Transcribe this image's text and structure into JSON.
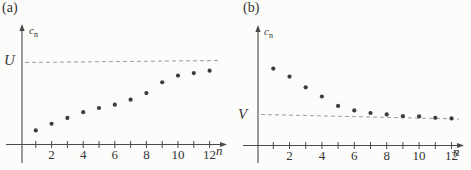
{
  "chart_data": [
    {
      "type": "scatter",
      "panel_label": "(a)",
      "title": "",
      "xlabel": "n",
      "ylabel": "c_n",
      "ylabel_base": "c",
      "ylabel_sub": "n",
      "x": [
        1,
        2,
        3,
        4,
        5,
        6,
        7,
        8,
        9,
        10,
        11,
        12
      ],
      "values": [
        0.17,
        0.25,
        0.32,
        0.39,
        0.44,
        0.48,
        0.54,
        0.62,
        0.75,
        0.83,
        0.86,
        0.89
      ],
      "values_note": "values read relative to dashed bound U = 1.0",
      "bound_line": {
        "label": "U",
        "value": 1.0,
        "style": "dashed",
        "relation": "upper-bound"
      },
      "x_tick_values": [
        2,
        4,
        6,
        8,
        10,
        12
      ],
      "x_tick_labels": [
        "2",
        "4",
        "6",
        "8",
        "10",
        "12"
      ],
      "xlim": [
        0,
        13
      ],
      "ylim": [
        0,
        1.4
      ],
      "grid": false,
      "legend": null
    },
    {
      "type": "scatter",
      "panel_label": "(b)",
      "title": "",
      "xlabel": "n",
      "ylabel": "c_n",
      "ylabel_base": "c",
      "ylabel_sub": "n",
      "x": [
        1,
        2,
        3,
        4,
        5,
        6,
        7,
        8,
        9,
        10,
        11,
        12
      ],
      "values": [
        2.7,
        2.42,
        2.04,
        1.72,
        1.39,
        1.23,
        1.14,
        1.09,
        1.03,
        1.02,
        0.97,
        0.95
      ],
      "values_note": "values read relative to dashed bound V = 1.0",
      "bound_line": {
        "label": "V",
        "value": 1.0,
        "style": "dashed",
        "relation": "lower-bound"
      },
      "x_tick_values": [
        2,
        4,
        6,
        8,
        10,
        12
      ],
      "x_tick_labels": [
        "2",
        "4",
        "6",
        "8",
        "10",
        "12"
      ],
      "xlim": [
        0,
        13
      ],
      "ylim": [
        0,
        3.9
      ],
      "grid": false,
      "legend": null
    }
  ],
  "colors": {
    "axis": "#4a4a4a",
    "dot": "#3d3d3d",
    "dashed_line": "#9b9b9b",
    "background": "#fcfcfa"
  }
}
